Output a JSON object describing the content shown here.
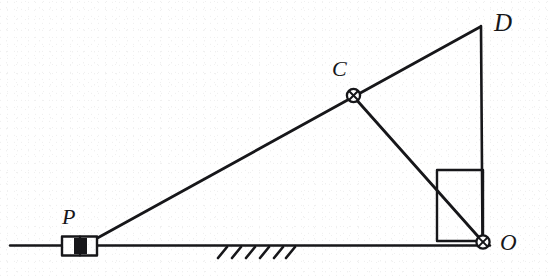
{
  "figure": {
    "type": "mechanism-kinematic-diagram",
    "width": 548,
    "height": 277,
    "background_color": "#ffffff",
    "ink_color": "#17171a"
  },
  "labels": {
    "point_d": "D",
    "point_c": "C",
    "point_p": "P",
    "point_o": "O"
  },
  "points": {
    "D": {
      "x": 480,
      "y": 26
    },
    "C": {
      "x": 353,
      "y": 95
    },
    "O": {
      "x": 483,
      "y": 242
    },
    "P": {
      "x": 80,
      "y": 246
    }
  },
  "joints": [
    {
      "name": "pivot-c",
      "cx": 353,
      "cy": 95,
      "r": 6.5,
      "style": "circle-with-cross"
    },
    {
      "name": "pivot-o",
      "cx": 483,
      "cy": 242,
      "r": 6.5,
      "style": "circle-with-cross"
    }
  ],
  "links": [
    {
      "name": "link-p-c-d",
      "from": "P",
      "to": "D",
      "through": "C"
    },
    {
      "name": "link-c-o",
      "from": "C",
      "to": "O"
    },
    {
      "name": "link-d-o",
      "from": "D",
      "to": "O"
    }
  ],
  "ground": {
    "line": {
      "x1": 10,
      "y1": 245.5,
      "x2": 490,
      "y2": 245.5
    },
    "hatch": {
      "count": 6,
      "x_start": 218,
      "spacing": 14,
      "dx": -9,
      "dy": 11
    }
  },
  "slider": {
    "name": "slider-block-p",
    "x": 62,
    "y": 236,
    "width": 35,
    "height": 19,
    "divider_x": 80,
    "fill": "dark"
  },
  "right_angle_box": {
    "name": "right-angle-marker",
    "x": 437,
    "y": 170,
    "width": 46,
    "height": 71
  }
}
